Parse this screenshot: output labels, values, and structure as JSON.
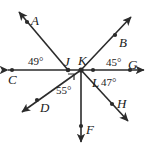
{
  "figure": {
    "type": "geometry-diagram",
    "stroke_color": "#2b2b2b",
    "background_color": "#ffffff",
    "line_label_left": "C",
    "line_label_right": "G"
  },
  "points": {
    "C": {
      "label": "C",
      "x": 12,
      "y": 70
    },
    "J": {
      "label": "J",
      "x": 68,
      "y": 70
    },
    "K": {
      "label": "K",
      "x": 81,
      "y": 70
    },
    "L": {
      "label": "L",
      "x": 93,
      "y": 70
    },
    "G": {
      "label": "G",
      "x": 130,
      "y": 70
    },
    "A": {
      "label": "A",
      "x": 27,
      "y": 22
    },
    "B": {
      "label": "B",
      "x": 120,
      "y": 33
    },
    "D": {
      "label": "D",
      "x": 38,
      "y": 101
    },
    "F": {
      "label": "F",
      "x": 81,
      "y": 127
    },
    "H": {
      "label": "H",
      "x": 115,
      "y": 105
    }
  },
  "angles": [
    {
      "name": "angle-AJC",
      "value": "49°",
      "vertex": "J"
    },
    {
      "name": "angle-BKG",
      "value": "45°",
      "vertex": "K"
    },
    {
      "name": "angle-HLG",
      "value": "47°",
      "vertex": "L"
    },
    {
      "name": "angle-DKF",
      "value": "55°",
      "vertex": "K"
    }
  ],
  "labels": {
    "A": "A",
    "B": "B",
    "C": "C",
    "D": "D",
    "F": "F",
    "G": "G",
    "H": "H",
    "J": "J",
    "K": "K",
    "L": "L",
    "angle_49": "49°",
    "angle_45": "45°",
    "angle_47": "47°",
    "angle_55": "55°"
  }
}
